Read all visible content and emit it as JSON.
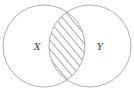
{
  "diagram": {
    "type": "venn",
    "sets": [
      {
        "label": "X",
        "cx": 44,
        "cy": 46,
        "r": 41
      },
      {
        "label": "Y",
        "cx": 90,
        "cy": 46,
        "r": 41
      }
    ],
    "shaded_region": "X ∩ Y",
    "shading": "diagonal-hatch",
    "stroke_color": "#999999"
  }
}
